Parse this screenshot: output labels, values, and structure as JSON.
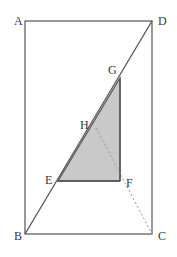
{
  "figure": {
    "canvas": {
      "width": 177,
      "height": 257
    },
    "background_color": "#ffffff",
    "stroke_color": "#555555",
    "dash_color": "#9a9a9a",
    "shade_fill": "#c9c9c9",
    "shade_stroke": "#555555",
    "label_color": "#3a3a3a",
    "rectangle": {
      "name": "ABCD",
      "x": 25,
      "y": 21,
      "width": 127,
      "height": 213
    },
    "points": {
      "A": {
        "x": 25,
        "y": 21,
        "label": "A",
        "label_x": 14,
        "label_y": 25
      },
      "B": {
        "x": 25,
        "y": 234,
        "label": "B",
        "label_x": 14,
        "label_y": 240
      },
      "C": {
        "x": 152,
        "y": 234,
        "label": "C",
        "label_x": 158,
        "label_y": 240
      },
      "D": {
        "x": 152,
        "y": 21,
        "label": "D",
        "label_x": 158,
        "label_y": 25
      },
      "E": {
        "x": 58,
        "y": 181,
        "label": "E",
        "label_x": 45,
        "label_y": 184
      },
      "F": {
        "x": 120,
        "y": 181,
        "label": "F",
        "label_x": 126,
        "label_y": 187
      },
      "G": {
        "x": 120,
        "y": 78,
        "label": "G",
        "label_x": 108,
        "label_y": 74
      },
      "H": {
        "x": 96,
        "y": 128,
        "label": "H",
        "label_x": 80,
        "label_y": 129
      }
    },
    "solid_segments": [
      {
        "name": "diagonal-BD",
        "from": "B",
        "to": "D"
      }
    ],
    "dashed_segments": [
      {
        "name": "dashed-H-to-C",
        "from": "H",
        "to": "C"
      }
    ],
    "shaded_triangle": {
      "name": "triangle-EFG",
      "vertices": [
        "E",
        "F",
        "G"
      ],
      "fill": "#c9c9c9"
    }
  }
}
